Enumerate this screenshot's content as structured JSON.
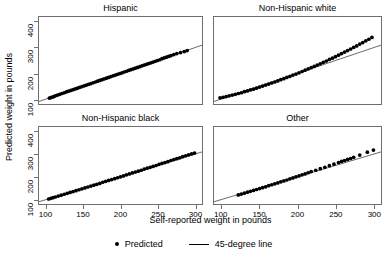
{
  "figure": {
    "width": 387,
    "height": 257,
    "background": "#ffffff",
    "frame_color": "#6f6f6f",
    "point_color": "#000000",
    "line_color": "#000000"
  },
  "axes": {
    "xlabel": "Self-reported weight in pounds",
    "ylabel": "Predicted weight in pounds",
    "xticks": [
      "100",
      "150",
      "200",
      "250",
      "300"
    ],
    "yticks": [
      "100",
      "200",
      "300",
      "400"
    ],
    "xlim": [
      90,
      310
    ],
    "ylim": [
      80,
      420
    ]
  },
  "legend": {
    "items": [
      {
        "label": "Predicted",
        "marker": "dot"
      },
      {
        "label": "45-degree line",
        "marker": "line"
      }
    ]
  },
  "chart_data": {
    "type": "scatter",
    "title": "",
    "xlabel": "Self-reported weight in pounds",
    "ylabel": "Predicted weight in pounds",
    "xlim": [
      90,
      310
    ],
    "ylim": [
      80,
      420
    ],
    "xticks": [
      100,
      150,
      200,
      250,
      300
    ],
    "yticks": [
      100,
      200,
      300,
      400
    ],
    "grid": false,
    "legend_position": "bottom-center",
    "reference_line": {
      "name": "45-degree line",
      "slope": 1,
      "intercept": 0
    },
    "panels": [
      {
        "title": "Hispanic",
        "row": 0,
        "col": 0,
        "series": [
          {
            "name": "Predicted",
            "x": [
              104,
              106,
              108,
              110,
              112,
              115,
              118,
              121,
              124,
              127,
              130,
              133,
              136,
              139,
              142,
              145,
              148,
              151,
              154,
              157,
              160,
              163,
              166,
              169,
              172,
              175,
              178,
              181,
              184,
              187,
              190,
              193,
              196,
              199,
              202,
              205,
              208,
              211,
              214,
              217,
              220,
              223,
              226,
              229,
              232,
              235,
              238,
              241,
              244,
              247,
              250,
              253,
              256,
              259,
              262,
              265,
              268,
              272,
              276,
              281,
              286,
              290
            ],
            "y": [
              103,
              105,
              107,
              109,
              112,
              115,
              118,
              121,
              124,
              127,
              130,
              133,
              136,
              139,
              142,
              145,
              148,
              151,
              154,
              157,
              160,
              163,
              166,
              169,
              172,
              175,
              178,
              181,
              184,
              187,
              190,
              193,
              196,
              199,
              202,
              205,
              208,
              211,
              214,
              217,
              220,
              223,
              226,
              229,
              232,
              235,
              238,
              241,
              244,
              247,
              250,
              253,
              257,
              260,
              263,
              266,
              269,
              273,
              277,
              281,
              285,
              289
            ]
          }
        ]
      },
      {
        "title": "Non-Hispanic white",
        "row": 0,
        "col": 1,
        "series": [
          {
            "name": "Predicted",
            "x": [
              98,
              102,
              106,
              110,
              114,
              118,
              122,
              126,
              130,
              134,
              138,
              142,
              146,
              150,
              154,
              158,
              162,
              166,
              170,
              174,
              178,
              182,
              186,
              190,
              194,
              198,
              202,
              206,
              210,
              214,
              218,
              222,
              226,
              230,
              234,
              238,
              242,
              246,
              250,
              254,
              258,
              262,
              266,
              270,
              274,
              278,
              282,
              286,
              290,
              294,
              298
            ],
            "y": [
              104,
              106,
              109,
              112,
              115,
              118,
              121,
              124,
              128,
              131,
              135,
              138,
              142,
              146,
              150,
              154,
              158,
              162,
              166,
              170,
              175,
              179,
              184,
              188,
              193,
              197,
              202,
              207,
              212,
              217,
              222,
              227,
              232,
              237,
              243,
              248,
              254,
              259,
              265,
              271,
              277,
              283,
              289,
              295,
              301,
              307,
              314,
              320,
              327,
              333,
              340
            ]
          }
        ]
      },
      {
        "title": "Non-Hispanic black",
        "row": 1,
        "col": 0,
        "series": [
          {
            "name": "Predicted",
            "x": [
              103,
              106,
              109,
              112,
              116,
              120,
              124,
              128,
              132,
              136,
              140,
              144,
              148,
              152,
              156,
              160,
              164,
              168,
              172,
              176,
              180,
              184,
              188,
              192,
              196,
              200,
              204,
              208,
              212,
              216,
              220,
              224,
              228,
              232,
              236,
              240,
              244,
              248,
              252,
              256,
              260,
              264,
              268,
              272,
              276,
              280,
              284,
              288,
              292,
              296,
              300
            ],
            "y": [
              102,
              105,
              108,
              111,
              115,
              119,
              123,
              127,
              131,
              135,
              139,
              143,
              147,
              151,
              155,
              159,
              163,
              167,
              171,
              176,
              180,
              184,
              188,
              192,
              196,
              200,
              204,
              209,
              213,
              217,
              221,
              225,
              229,
              234,
              238,
              242,
              246,
              250,
              255,
              259,
              263,
              267,
              272,
              276,
              280,
              284,
              289,
              293,
              297,
              301,
              305
            ]
          }
        ]
      },
      {
        "title": "Other",
        "row": 1,
        "col": 1,
        "series": [
          {
            "name": "Predicted",
            "x": [
              122,
              126,
              130,
              134,
              138,
              142,
              146,
              150,
              154,
              158,
              162,
              166,
              170,
              174,
              178,
              182,
              186,
              190,
              194,
              198,
              202,
              206,
              210,
              214,
              218,
              224,
              230,
              236,
              242,
              248,
              254,
              258,
              262,
              266,
              270,
              274,
              282,
              292,
              300
            ],
            "y": [
              120,
              124,
              128,
              132,
              136,
              140,
              144,
              148,
              152,
              156,
              161,
              165,
              169,
              173,
              178,
              182,
              186,
              191,
              195,
              200,
              204,
              209,
              213,
              218,
              223,
              229,
              236,
              242,
              249,
              256,
              263,
              268,
              272,
              277,
              281,
              286,
              296,
              309,
              318
            ]
          }
        ]
      }
    ]
  }
}
